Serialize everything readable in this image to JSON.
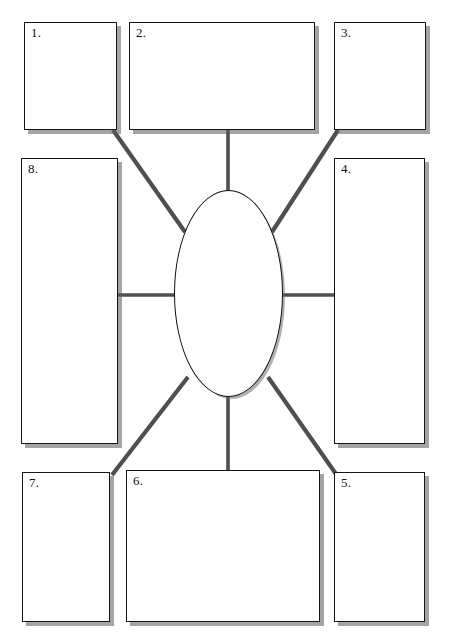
{
  "worksheet": {
    "title": "Graphic Organizer Worksheet",
    "center": {
      "name": "center-oval",
      "label": "",
      "shape": "ellipse"
    },
    "boxes": [
      {
        "id": "box-1",
        "label": "1.",
        "x": 24,
        "y": 22,
        "w": 93,
        "h": 108
      },
      {
        "id": "box-2",
        "label": "2.",
        "x": 129,
        "y": 22,
        "w": 186,
        "h": 108
      },
      {
        "id": "box-3",
        "label": "3.",
        "x": 334,
        "y": 22,
        "w": 92,
        "h": 108
      },
      {
        "id": "box-4",
        "label": "4.",
        "x": 334,
        "y": 158,
        "w": 91,
        "h": 286
      },
      {
        "id": "box-5",
        "label": "5.",
        "x": 334,
        "y": 472,
        "w": 91,
        "h": 150
      },
      {
        "id": "box-6",
        "label": "6.",
        "x": 126,
        "y": 470,
        "w": 194,
        "h": 152
      },
      {
        "id": "box-7",
        "label": "7.",
        "x": 22,
        "y": 472,
        "w": 88,
        "h": 150
      },
      {
        "id": "box-8",
        "label": "8.",
        "x": 21,
        "y": 158,
        "w": 97,
        "h": 286
      }
    ],
    "connectors": [
      {
        "id": "connector-1",
        "from": "box-1",
        "to": "center-oval",
        "kind": "diagonal"
      },
      {
        "id": "connector-2",
        "from": "box-2",
        "to": "center-oval",
        "kind": "vertical"
      },
      {
        "id": "connector-3",
        "from": "box-3",
        "to": "center-oval",
        "kind": "diagonal"
      },
      {
        "id": "connector-4",
        "from": "box-4",
        "to": "center-oval",
        "kind": "horizontal"
      },
      {
        "id": "connector-5",
        "from": "box-5",
        "to": "center-oval",
        "kind": "diagonal"
      },
      {
        "id": "connector-6",
        "from": "box-6",
        "to": "center-oval",
        "kind": "vertical"
      },
      {
        "id": "connector-7",
        "from": "box-7",
        "to": "center-oval",
        "kind": "diagonal"
      },
      {
        "id": "connector-8",
        "from": "box-8",
        "to": "center-oval",
        "kind": "horizontal"
      }
    ],
    "colors": {
      "page_background": "#ffffff",
      "box_fill": "#ffffff",
      "box_border": "#161616",
      "box_shadow": "#6b6b6b",
      "connector_line": "#4a4a4a",
      "label_text": "#111111"
    }
  }
}
